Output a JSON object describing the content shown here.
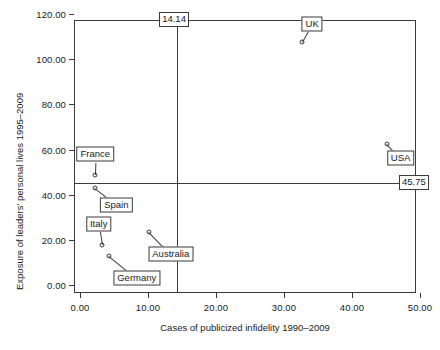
{
  "chart_data": {
    "type": "scatter",
    "title": "",
    "xlabel": "Cases of publicized infidelity 1990–2009",
    "ylabel": "Exposure of leaders' personal lives 1995–2009",
    "xlim": [
      0,
      50
    ],
    "ylim": [
      0,
      120
    ],
    "xticks": [
      "0.00",
      "10.00",
      "20.00",
      "30.00",
      "40.00",
      "50.00"
    ],
    "xtick_values": [
      0,
      10,
      20,
      30,
      40,
      50
    ],
    "yticks": [
      "0.00",
      "20.00",
      "40.00",
      "60.00",
      "80.00",
      "100.00",
      "120.00"
    ],
    "ytick_values": [
      0,
      20,
      40,
      60,
      80,
      100,
      120
    ],
    "grid": false,
    "legend": "none",
    "reference_lines": [
      {
        "id": "vertical-mean",
        "orientation": "vertical",
        "value": 14.14,
        "label": "14.14"
      },
      {
        "id": "horizontal-mean",
        "orientation": "horizontal",
        "value": 45.75,
        "label": "45.75"
      }
    ],
    "points": [
      {
        "label": "France",
        "x": 2.0,
        "y": 49.0,
        "label_x": 2.1,
        "label_y": 58.5
      },
      {
        "label": "Spain",
        "x": 2.0,
        "y": 43.5,
        "label_x": 5.2,
        "label_y": 36.0
      },
      {
        "label": "Italy",
        "x": 3.1,
        "y": 18.0,
        "label_x": 2.6,
        "label_y": 27.5
      },
      {
        "label": "Germany",
        "x": 4.1,
        "y": 13.5,
        "label_x": 8.2,
        "label_y": 3.5
      },
      {
        "label": "Australia",
        "x": 10.0,
        "y": 24.0,
        "label_x": 13.2,
        "label_y": 14.0
      },
      {
        "label": "UK",
        "x": 32.5,
        "y": 108.0,
        "label_x": 34.0,
        "label_y": 116.0
      },
      {
        "label": "USA",
        "x": 45.0,
        "y": 63.0,
        "label_x": 47.0,
        "label_y": 56.5
      }
    ]
  }
}
